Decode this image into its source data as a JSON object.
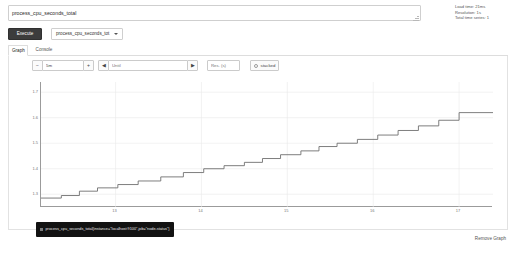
{
  "expression": {
    "value": "process_cpu_seconds_total",
    "placeholder": "Expression (press Shift+Enter for newlines)"
  },
  "stats": {
    "load_time": "Load time: 21ms",
    "resolution": "Resolution: 1s",
    "total_time_series": "Total time series: 1"
  },
  "toolbar": {
    "execute_label": "Execute",
    "metric_selected": "process_cpu_seconds_tot"
  },
  "tabs": [
    {
      "label": "Graph",
      "active": true
    },
    {
      "label": "Console",
      "active": false
    }
  ],
  "graph_controls": {
    "range_decrement": "−",
    "range_value": "5m",
    "range_increment": "+",
    "until_back": "◀",
    "until_value": "Until",
    "until_placeholder": "Until",
    "until_forward": "▶",
    "resolution_placeholder": "Res. (s)",
    "resolution_value": "",
    "stacked_label": "stacked",
    "stacked_checked": false
  },
  "tooltip": {
    "text": "process_cpu_seconds_total{instance=\"localhost:9100\",job=\"node-status\"}",
    "series_color": "#7a7a7a"
  },
  "footer": {
    "remove_graph": "Remove Graph"
  },
  "chart_data": {
    "type": "line",
    "title": "",
    "xlabel": "",
    "ylabel": "",
    "grid": true,
    "legend_position": "bottom-left",
    "line_color": "#6f6f6f",
    "ylim": [
      1.25,
      1.74
    ],
    "yticks": [
      1.3,
      1.4,
      1.5,
      1.6,
      1.7
    ],
    "ytick_labels": [
      "1.3",
      "1.4",
      "1.5",
      "1.6",
      "1.7"
    ],
    "xticks": [
      0.165,
      0.355,
      0.545,
      0.735,
      0.925
    ],
    "xtick_labels": [
      "13",
      "14",
      "15",
      "16",
      "17"
    ],
    "series": [
      {
        "name": "process_cpu_seconds_total{instance=\"localhost:9100\",job=\"node-status\"}",
        "step": true,
        "x": [
          0.0,
          0.045,
          0.085,
          0.125,
          0.17,
          0.215,
          0.265,
          0.315,
          0.36,
          0.405,
          0.45,
          0.49,
          0.53,
          0.575,
          0.615,
          0.655,
          0.7,
          0.745,
          0.79,
          0.835,
          0.88,
          0.925,
          1.0
        ],
        "values": [
          1.285,
          1.295,
          1.312,
          1.325,
          1.338,
          1.352,
          1.368,
          1.385,
          1.4,
          1.412,
          1.425,
          1.44,
          1.455,
          1.47,
          1.487,
          1.5,
          1.515,
          1.532,
          1.55,
          1.568,
          1.59,
          1.62,
          1.62
        ]
      }
    ]
  }
}
